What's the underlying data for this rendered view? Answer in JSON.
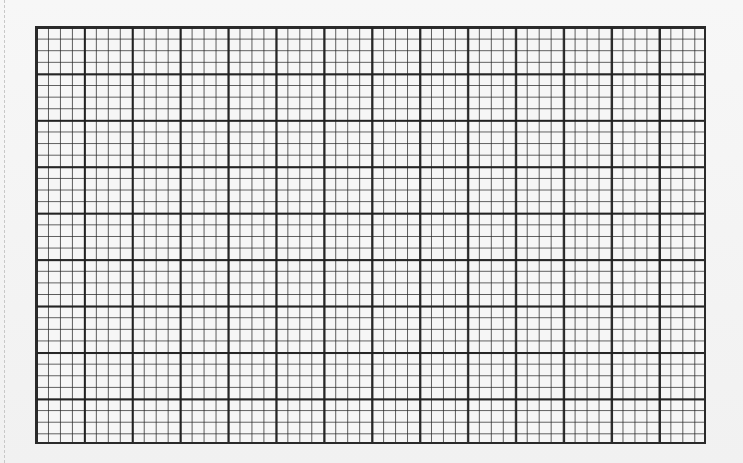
{
  "sheet": {
    "type": "graph-paper",
    "paper_color": "#f4f4f4",
    "line_color": "#2a2a2a",
    "major_columns": 14,
    "major_rows": 9,
    "subdivisions_per_major": 4,
    "minor_columns": 56,
    "minor_rows": 36
  }
}
